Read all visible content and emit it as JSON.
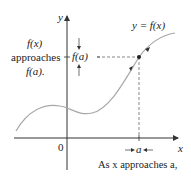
{
  "diagram": {
    "axis_labels": {
      "y": "y",
      "x": "x",
      "origin": "0"
    },
    "curve_label": "y = f(x)",
    "point_label_y": "f(a)",
    "point_label_x": "a",
    "left_annotation": [
      "f(x)",
      "approaches",
      "f(a)."
    ],
    "bottom_annotation": "As x approaches a,",
    "colors": {
      "axis": "#333333",
      "curve": "#a8a8a8",
      "dashed": "#555555",
      "text": "#222222"
    }
  }
}
